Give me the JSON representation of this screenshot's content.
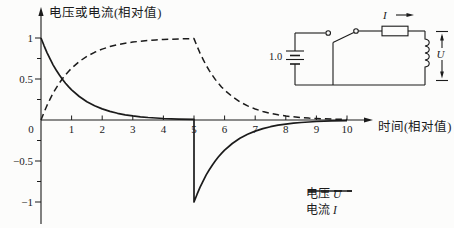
{
  "figure": {
    "background": "#fcfcfb",
    "ink": "#1b1b1b"
  },
  "chart_data": {
    "type": "line",
    "title": "",
    "ylabel": "电压或电流(相对值)",
    "xlabel": "时间(相对值)",
    "xlim": [
      0,
      11.5
    ],
    "ylim": [
      -1.3,
      1.35
    ],
    "grid": false,
    "legend_position": "lower right",
    "x_ticks": [
      0,
      1,
      2,
      3,
      4,
      5,
      6,
      7,
      8,
      9,
      10
    ],
    "x_tick_labels": [
      "0",
      "1",
      "2",
      "3",
      "4",
      "5",
      "6",
      "7",
      "8",
      "9",
      "10"
    ],
    "y_ticks": [
      {
        "v": 1,
        "label": "1"
      },
      {
        "v": 0.5,
        "label": "0.5"
      },
      {
        "v": -0.5,
        "label": "−0.5"
      },
      {
        "v": -1,
        "label": "−1"
      }
    ],
    "y_ticks_minor": [
      0.75,
      0.25,
      -0.25,
      -0.75
    ],
    "series": [
      {
        "label": "电压",
        "symbol": "U",
        "style": "solid",
        "description": "U = e^-t for 0<=t<5, jumps to -1 at t=5, then U = -e^-(t-5)",
        "points": [
          [
            0,
            1
          ],
          [
            0.1,
            0.905
          ],
          [
            0.2,
            0.819
          ],
          [
            0.3,
            0.741
          ],
          [
            0.4,
            0.67
          ],
          [
            0.5,
            0.607
          ],
          [
            0.6,
            0.549
          ],
          [
            0.7,
            0.497
          ],
          [
            0.8,
            0.449
          ],
          [
            0.9,
            0.407
          ],
          [
            1,
            0.368
          ],
          [
            1.25,
            0.287
          ],
          [
            1.5,
            0.223
          ],
          [
            1.75,
            0.174
          ],
          [
            2,
            0.135
          ],
          [
            2.25,
            0.105
          ],
          [
            2.5,
            0.082
          ],
          [
            2.75,
            0.064
          ],
          [
            3,
            0.05
          ],
          [
            3.25,
            0.039
          ],
          [
            3.5,
            0.03
          ],
          [
            3.75,
            0.024
          ],
          [
            4,
            0.018
          ],
          [
            4.5,
            0.011
          ],
          [
            5,
            0.007
          ],
          [
            5,
            -1
          ],
          [
            5.1,
            -0.905
          ],
          [
            5.2,
            -0.819
          ],
          [
            5.3,
            -0.741
          ],
          [
            5.4,
            -0.67
          ],
          [
            5.5,
            -0.607
          ],
          [
            5.6,
            -0.549
          ],
          [
            5.7,
            -0.497
          ],
          [
            5.8,
            -0.449
          ],
          [
            5.9,
            -0.407
          ],
          [
            6,
            -0.368
          ],
          [
            6.25,
            -0.287
          ],
          [
            6.5,
            -0.223
          ],
          [
            6.75,
            -0.174
          ],
          [
            7,
            -0.135
          ],
          [
            7.25,
            -0.105
          ],
          [
            7.5,
            -0.082
          ],
          [
            7.75,
            -0.064
          ],
          [
            8,
            -0.05
          ],
          [
            8.25,
            -0.039
          ],
          [
            8.5,
            -0.03
          ],
          [
            8.75,
            -0.024
          ],
          [
            9,
            -0.018
          ],
          [
            9.5,
            -0.011
          ],
          [
            10,
            -0.007
          ]
        ]
      },
      {
        "label": "电流",
        "symbol": "I",
        "style": "dashed",
        "description": "I = 1-e^-t for 0<=t<5, then I = e^-(t-5)",
        "points": [
          [
            0,
            0
          ],
          [
            0.1,
            0.095
          ],
          [
            0.2,
            0.181
          ],
          [
            0.3,
            0.259
          ],
          [
            0.4,
            0.33
          ],
          [
            0.5,
            0.393
          ],
          [
            0.6,
            0.451
          ],
          [
            0.7,
            0.503
          ],
          [
            0.8,
            0.551
          ],
          [
            0.9,
            0.593
          ],
          [
            1,
            0.632
          ],
          [
            1.25,
            0.713
          ],
          [
            1.5,
            0.777
          ],
          [
            1.75,
            0.826
          ],
          [
            2,
            0.865
          ],
          [
            2.25,
            0.895
          ],
          [
            2.5,
            0.918
          ],
          [
            2.75,
            0.936
          ],
          [
            3,
            0.95
          ],
          [
            3.25,
            0.961
          ],
          [
            3.5,
            0.97
          ],
          [
            3.75,
            0.976
          ],
          [
            4,
            0.982
          ],
          [
            4.5,
            0.989
          ],
          [
            5,
            0.993
          ],
          [
            5.1,
            0.899
          ],
          [
            5.2,
            0.813
          ],
          [
            5.3,
            0.736
          ],
          [
            5.4,
            0.666
          ],
          [
            5.5,
            0.602
          ],
          [
            5.6,
            0.545
          ],
          [
            5.7,
            0.493
          ],
          [
            5.8,
            0.446
          ],
          [
            5.9,
            0.404
          ],
          [
            6,
            0.365
          ],
          [
            6.25,
            0.285
          ],
          [
            6.5,
            0.221
          ],
          [
            6.75,
            0.172
          ],
          [
            7,
            0.134
          ],
          [
            7.25,
            0.104
          ],
          [
            7.5,
            0.081
          ],
          [
            7.75,
            0.063
          ],
          [
            8,
            0.049
          ],
          [
            8.25,
            0.039
          ],
          [
            8.5,
            0.03
          ],
          [
            8.75,
            0.023
          ],
          [
            9,
            0.018
          ],
          [
            9.5,
            0.011
          ],
          [
            10,
            0.007
          ]
        ]
      }
    ]
  },
  "circuit": {
    "emf_label": "1.0",
    "current_label": "I",
    "voltage_label": "U"
  }
}
